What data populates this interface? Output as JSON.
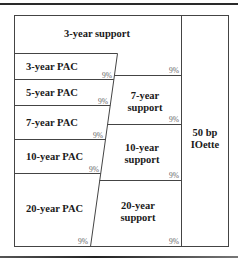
{
  "diagram": {
    "columns": {
      "pac_column": {
        "cells": [
          {
            "label": "3-year PAC",
            "pct": "9%"
          },
          {
            "label": "5-year PAC",
            "pct": "9%"
          },
          {
            "label": "7-year PAC",
            "pct": "9%"
          },
          {
            "label": "10-year PAC",
            "pct": "9%"
          },
          {
            "label": "20-year PAC",
            "pct": "9%"
          }
        ]
      },
      "support_column": {
        "cells": [
          {
            "label_line1": "3-year support",
            "label_line2": "",
            "pct": "9%"
          },
          {
            "label_line1": "7-year",
            "label_line2": "support",
            "pct": "9%"
          },
          {
            "label_line1": "10-year",
            "label_line2": "support",
            "pct": "9%"
          },
          {
            "label_line1": "20-year",
            "label_line2": "support",
            "pct": "9%"
          }
        ]
      },
      "right_column": {
        "label_line1": "50 bp",
        "label_line2": "IOette"
      }
    },
    "colors": {
      "line": "#444444",
      "text": "#1a1a1a",
      "pct_text": "#666666"
    }
  }
}
